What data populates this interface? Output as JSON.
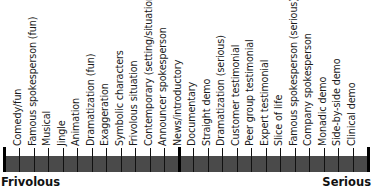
{
  "diagram": {
    "type": "continuum-scale",
    "left_end_label": "Frivolous",
    "right_end_label": "Serious",
    "items": [
      "Comedy/fun",
      "Famous spokesperson (fun)",
      "Musical",
      "Jingle",
      "Animation",
      "Dramatization (fun)",
      "Exaggeration",
      "Symbolic characters",
      "Frivolous situation",
      "Contemporary (setting/situations)",
      "Announcer spokesperson",
      "News/introductory",
      "Documentary",
      "Straight demo",
      "Dramatization (serious)",
      "Customer testimonial",
      "Peer group testimonial",
      "Expert testimonial",
      "Slice of life",
      "Famous spokesperson (serious)",
      "Company spokesperson",
      "Monadic demo",
      "Side-by-side demo",
      "Clinical demo"
    ],
    "divider_after_index": 10,
    "colors": {
      "bar": "#4a4a4a",
      "ticks": "#111111",
      "text": "#1a1a1a"
    }
  }
}
